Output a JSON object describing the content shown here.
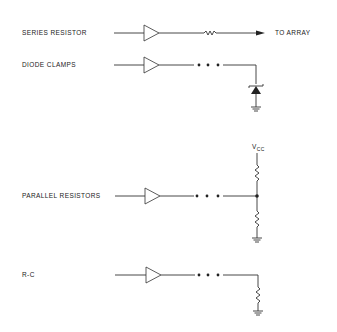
{
  "diagram": {
    "type": "termination-schemes",
    "rows": [
      {
        "id": "series-resistor",
        "label": "SERIES RESISTOR",
        "output_label": "TO ARRAY",
        "components": [
          "buffer",
          "resistor",
          "arrow"
        ]
      },
      {
        "id": "diode-clamps",
        "label": "DIODE CLAMPS",
        "components": [
          "buffer",
          "ellipsis",
          "diode",
          "ground"
        ]
      },
      {
        "id": "parallel-resistors",
        "label": "PARALLEL RESISTORS",
        "supply_label": "V",
        "supply_subscript": "CC",
        "components": [
          "buffer",
          "ellipsis",
          "resistor-to-vcc",
          "junction",
          "resistor-to-ground",
          "ground"
        ]
      },
      {
        "id": "r-c",
        "label": "R-C",
        "components": [
          "buffer",
          "ellipsis",
          "resistor",
          "ground"
        ]
      }
    ],
    "colors": {
      "ink": "#333333",
      "background": "#ffffff"
    }
  }
}
